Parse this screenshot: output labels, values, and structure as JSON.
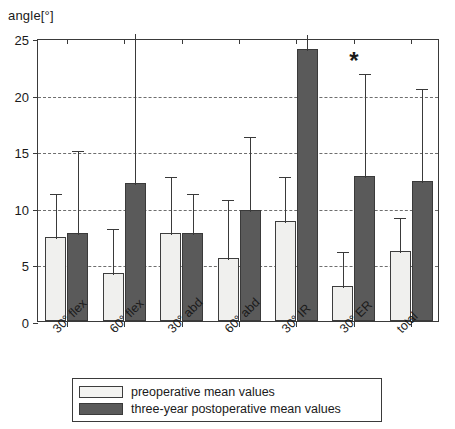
{
  "chart_data": {
    "type": "bar",
    "title": "",
    "ylabel": "angle[°]",
    "xlabel": "",
    "ylim": [
      0,
      25
    ],
    "yticks": [
      0,
      5,
      10,
      15,
      20,
      25
    ],
    "grid": true,
    "grid_axis": "y",
    "legend_position": "below-axes",
    "categories": [
      "30° flex",
      "60° flex",
      "30° abd",
      "60° abd",
      "30° IR",
      "30° ER",
      "total"
    ],
    "series": [
      {
        "name": "preoperative mean values",
        "color": "#f0f0ee",
        "values": [
          7.4,
          4.2,
          7.8,
          5.6,
          8.8,
          3.1,
          6.2
        ],
        "errors_upper": [
          11.4,
          8.3,
          12.9,
          10.9,
          12.9,
          6.3,
          9.3
        ]
      },
      {
        "name": "three-year postoperative mean values",
        "color": "#5a5a5a",
        "values": [
          7.8,
          12.2,
          7.8,
          9.8,
          24.0,
          12.8,
          12.4
        ],
        "errors_upper": [
          15.2,
          25.6,
          11.4,
          16.4,
          25.4,
          22.0,
          20.7
        ]
      }
    ],
    "annotations": [
      {
        "text": "*",
        "category": "30° ER",
        "value": 24.2
      }
    ]
  },
  "axis": {
    "y_title": "angle[°]",
    "tick_labels": [
      "25",
      "20",
      "15",
      "10",
      "5",
      "0"
    ]
  },
  "legend": {
    "items": [
      {
        "label": "preoperative mean values",
        "swatch": "light-square-swatch"
      },
      {
        "label": "three-year postoperative mean values",
        "swatch": "dark-square-swatch"
      }
    ]
  }
}
